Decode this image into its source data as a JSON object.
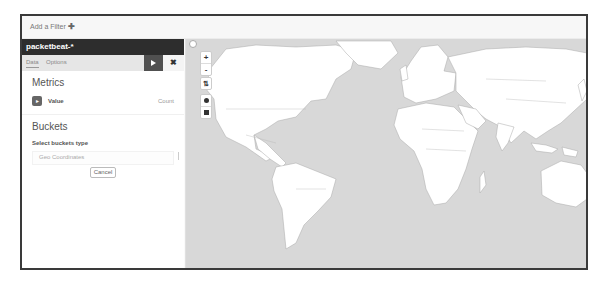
{
  "filter_bar": {
    "add_filter_label": "Add a Filter",
    "add_icon": "plus-icon"
  },
  "sidebar": {
    "index_pattern": "packetbeat-*",
    "tabs": [
      {
        "label": "Data",
        "active": true
      },
      {
        "label": "Options",
        "active": false
      }
    ],
    "apply_button_icon": "play-icon",
    "discard_button_icon": "close-icon",
    "discard_label": "✖",
    "metrics": {
      "title": "Metrics",
      "items": [
        {
          "badge": "▸",
          "label": "Value",
          "value": "Count"
        }
      ]
    },
    "buckets": {
      "title": "Buckets",
      "select_label": "Select buckets type",
      "option": "Geo Coordinates",
      "cancel_label": "Cancel"
    }
  },
  "map": {
    "controls": {
      "zoom_in": "+",
      "zoom_out": "-",
      "fit_bounds": "⇅"
    },
    "colors": {
      "ocean": "#d8d8d8",
      "land": "#ffffff",
      "border": "#9a9a9a"
    }
  }
}
